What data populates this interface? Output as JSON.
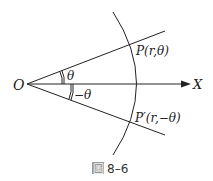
{
  "diagram": {
    "origin_label": "O",
    "axis_label": "X",
    "point_upper_label": "P(r,θ)",
    "point_lower_label": "P′(r,−θ)",
    "angle_upper_label": "θ",
    "angle_lower_label": "−θ",
    "caption_icon": "圖",
    "caption_number": "8–6",
    "colors": {
      "line": "#222222",
      "caption_box": "#888888"
    }
  }
}
